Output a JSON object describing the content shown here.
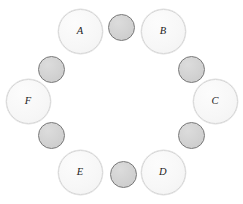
{
  "diagram": {
    "canvas": {
      "width": 243,
      "height": 204,
      "background": "#ffffff"
    },
    "style": {
      "major_fill": "#f7f7f7",
      "major_border": "#d6d6d6",
      "major_diameter": 45,
      "minor_fill": "#d2d2d2",
      "minor_border": "#777777",
      "minor_diameter": 27,
      "label_color": "#1c1c1c"
    },
    "major_nodes": [
      {
        "label": "A",
        "cx": 80,
        "cy": 31,
        "position": "top-left"
      },
      {
        "label": "B",
        "cx": 163,
        "cy": 31,
        "position": "top-right"
      },
      {
        "label": "C",
        "cx": 215,
        "cy": 101,
        "position": "right"
      },
      {
        "label": "D",
        "cx": 163,
        "cy": 172,
        "position": "bottom-right"
      },
      {
        "label": "E",
        "cx": 80,
        "cy": 172,
        "position": "bottom-left"
      },
      {
        "label": "F",
        "cx": 28,
        "cy": 101,
        "position": "left"
      }
    ],
    "minor_nodes": [
      {
        "label": "",
        "cx": 121,
        "cy": 27,
        "position": "top-center"
      },
      {
        "label": "",
        "cx": 191,
        "cy": 69,
        "position": "upper-right"
      },
      {
        "label": "",
        "cx": 191,
        "cy": 135,
        "position": "lower-right"
      },
      {
        "label": "",
        "cx": 123,
        "cy": 174,
        "position": "bottom-center"
      },
      {
        "label": "",
        "cx": 51,
        "cy": 135,
        "position": "lower-left"
      },
      {
        "label": "",
        "cx": 51,
        "cy": 69,
        "position": "upper-left"
      }
    ]
  }
}
